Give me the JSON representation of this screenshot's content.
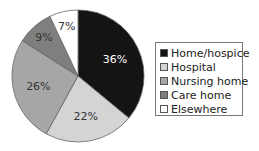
{
  "chart_data": {
    "type": "pie",
    "title": "",
    "categories": [
      "Home/hospice",
      "Hospital",
      "Nursing home",
      "Care home",
      "Elsewhere"
    ],
    "values": [
      36,
      22,
      26,
      9,
      7
    ],
    "labels": [
      "36%",
      "22%",
      "26%",
      "9%",
      "7%"
    ],
    "colors": [
      "#141414",
      "#d4d4d4",
      "#a6a6a6",
      "#7f7f7f",
      "#ffffff"
    ],
    "label_colors": [
      "#ffffff",
      "#333333",
      "#333333",
      "#333333",
      "#333333"
    ],
    "legend_position": "right",
    "start_angle": "top, clockwise"
  },
  "legend": {
    "items": [
      {
        "label": "Home/hospice",
        "color": "#141414"
      },
      {
        "label": "Hospital",
        "color": "#d4d4d4"
      },
      {
        "label": "Nursing home",
        "color": "#a6a6a6"
      },
      {
        "label": "Care home",
        "color": "#7f7f7f"
      },
      {
        "label": "Elsewhere",
        "color": "#ffffff"
      }
    ]
  }
}
